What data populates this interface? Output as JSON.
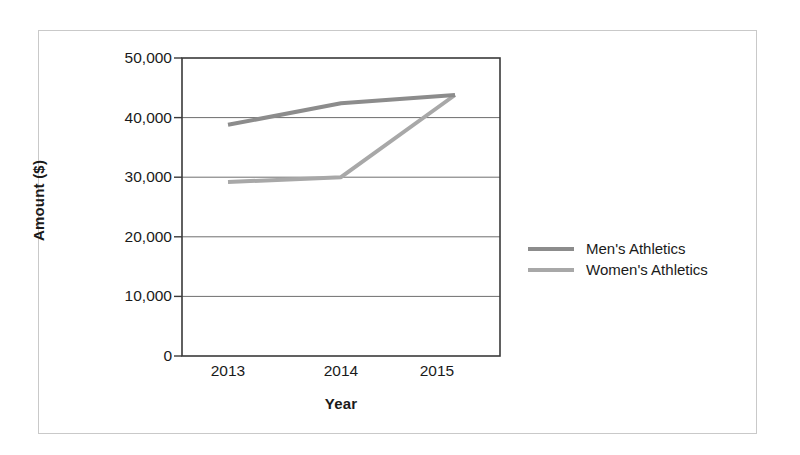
{
  "chart_data": {
    "type": "line",
    "title": "",
    "xlabel": "Year",
    "ylabel": "Amount ($)",
    "categories": [
      "2013",
      "2014",
      "2015"
    ],
    "x": [
      2013,
      2014,
      2015
    ],
    "ylim": [
      0,
      50000
    ],
    "xlim": [
      2012.6,
      2015.4
    ],
    "grid": true,
    "legend_position": "right",
    "y_ticks": [
      "0",
      "10,000",
      "20,000",
      "30,000",
      "40,000",
      "50,000"
    ],
    "y_tick_values": [
      0,
      10000,
      20000,
      30000,
      40000,
      50000
    ],
    "series": [
      {
        "name": "Men's Athletics",
        "values": [
          38800,
          42400,
          43800
        ],
        "color": "#8c8c8c"
      },
      {
        "name": "Women's Athletics",
        "values": [
          29200,
          30000,
          43800
        ],
        "color": "#a8a8a8"
      }
    ]
  },
  "legend": {
    "items": [
      {
        "label": "Men's Athletics",
        "color": "#8c8c8c"
      },
      {
        "label": "Women's Athletics",
        "color": "#a8a8a8"
      }
    ]
  },
  "axes": {
    "y_title": "Amount ($)",
    "x_title": "Year",
    "y_ticks": [
      "50,000",
      "40,000",
      "30,000",
      "20,000",
      "10,000",
      "0"
    ],
    "x_ticks": [
      "2013",
      "2014",
      "2015"
    ]
  },
  "colors": {
    "frame_border": "#c9c9c9",
    "plot_border": "#3a3a3a",
    "gridline": "#6e6e6e",
    "text": "#1a1a1a",
    "background": "#ffffff"
  }
}
